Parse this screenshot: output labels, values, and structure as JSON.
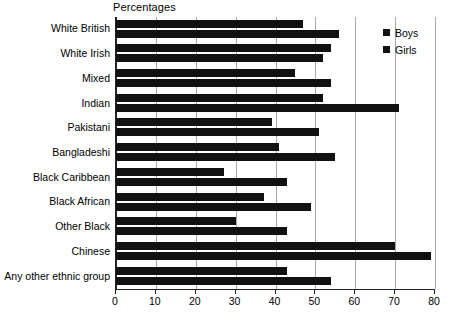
{
  "chart_data": {
    "type": "bar",
    "orientation": "horizontal",
    "title": "",
    "xlabel": "Percentages",
    "ylabel": "",
    "xlim": [
      0,
      80
    ],
    "xticks": [
      0,
      10,
      20,
      30,
      40,
      50,
      60,
      70,
      80
    ],
    "xtick_labels": [
      "0",
      "10",
      "20",
      "30",
      "40",
      "50",
      "60",
      "70",
      "80"
    ],
    "grid": true,
    "grid_axis": "x",
    "legend_position": "top-right",
    "categories": [
      "White British",
      "White Irish",
      "Mixed",
      "Indian",
      "Pakistani",
      "Bangladeshi",
      "Black Caribbean",
      "Black African",
      "Other Black",
      "Chinese",
      "Any other ethnic group"
    ],
    "series": [
      {
        "name": "Boys",
        "color": "#111111",
        "values": [
          47,
          54,
          45,
          52,
          39,
          41,
          27,
          37,
          30,
          70,
          43
        ]
      },
      {
        "name": "Girls",
        "color": "#111111",
        "values": [
          56,
          52,
          54,
          71,
          51,
          55,
          43,
          49,
          43,
          79,
          54
        ]
      }
    ]
  },
  "axis": {
    "x_title": "Percentages"
  },
  "legend": {
    "items": [
      {
        "label": "Boys"
      },
      {
        "label": "Girls"
      }
    ]
  }
}
